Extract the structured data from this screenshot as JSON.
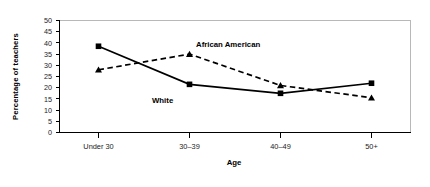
{
  "chart_data": {
    "type": "line",
    "title": "",
    "xlabel": "Age",
    "ylabel": "Percentage of teachers",
    "categories": [
      "Under 30",
      "30–39",
      "40–49",
      "50+"
    ],
    "ylim": [
      0,
      50
    ],
    "yticks": [
      0,
      5,
      10,
      15,
      20,
      25,
      30,
      35,
      40,
      45,
      50
    ],
    "ytick_labels": [
      "0",
      "5",
      "10",
      "15",
      "20",
      "25",
      "30",
      "35",
      "40",
      "45",
      "50"
    ],
    "grid": false,
    "legend_position": "inline-annotations",
    "series": [
      {
        "name": "White",
        "values": [
          38.5,
          21.5,
          17.5,
          22
        ],
        "line_style": "solid",
        "marker": "square",
        "color": "#000000",
        "annotation": "White"
      },
      {
        "name": "African American",
        "values": [
          28,
          35,
          21,
          15.5
        ],
        "line_style": "dashed",
        "marker": "triangle",
        "color": "#000000",
        "annotation": "African American"
      }
    ],
    "annotations": [
      {
        "text": "African American",
        "category": "30–39",
        "value": 38
      },
      {
        "text": "White",
        "category": "30–39",
        "value": 17
      }
    ]
  },
  "axes": {
    "y_axis_title": "Percentage of teachers",
    "x_axis_title": "Age"
  },
  "colors": {
    "ink": "#000000",
    "frame": "#b8b8b8",
    "background": "#ffffff"
  }
}
